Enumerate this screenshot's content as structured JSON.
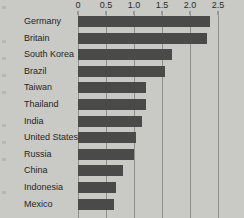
{
  "chart_data": {
    "type": "bar",
    "orientation": "horizontal",
    "title": "",
    "subtitle": "",
    "xlabel": "",
    "ylabel": "",
    "xlim": [
      0,
      2.5
    ],
    "grid": true,
    "legend": false,
    "legend_position": "none",
    "axis_position": "top",
    "tick_labels": [
      "0",
      "0.5",
      "1.0",
      "1.5",
      "2.0",
      "2.5"
    ],
    "tick_values": [
      0,
      0.5,
      1.0,
      1.5,
      2.0,
      2.5
    ],
    "categories": [
      "Germany",
      "Britain",
      "South Korea",
      "Brazil",
      "Taiwan",
      "Thailand",
      "India",
      "United States",
      "Russia",
      "China",
      "Indonesia",
      "Mexico"
    ],
    "values": [
      2.35,
      2.3,
      1.67,
      1.56,
      1.22,
      1.22,
      1.15,
      1.03,
      1.0,
      0.8,
      0.67,
      0.64
    ],
    "bar_color": "#4a4a48",
    "background_color": "#c9c9c5",
    "gridline_color": "#8e8e8a",
    "note": "Bottom bar (Mexico) is clipped by the image edge"
  }
}
